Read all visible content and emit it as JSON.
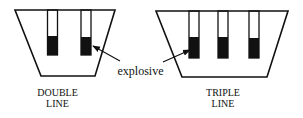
{
  "diagram": {
    "colors": {
      "stroke": "#111111",
      "fill": "#111111",
      "background": "#ffffff"
    },
    "annotation": {
      "label": "explosive",
      "icon": "arrow-icon"
    },
    "left": {
      "caption_line1": "DOUBLE",
      "caption_line2": "LINE",
      "tubes": 2
    },
    "right": {
      "caption_line1": "TRIPLE",
      "caption_line2": "LINE",
      "tubes": 3
    }
  }
}
